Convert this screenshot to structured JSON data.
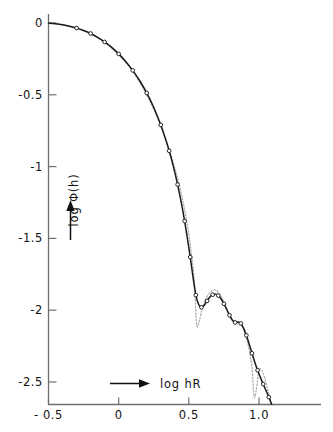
{
  "chart_data": {
    "type": "line",
    "title": "",
    "subtitle": "",
    "xlabel": "log hR",
    "ylabel": "log Φ(h)",
    "xlim": [
      -0.5,
      1.25
    ],
    "ylim": [
      -2.75,
      0.1
    ],
    "grid": false,
    "legend": "none",
    "xticks": [
      -0.5,
      0,
      0.5,
      1.0
    ],
    "xticklabels": [
      "- 0.5",
      "0",
      "0.5",
      "1.0"
    ],
    "yticks": [
      0,
      -0.5,
      -1,
      -1.5,
      -2,
      -2.5
    ],
    "yticklabels": [
      "0",
      "-0.5",
      "-1",
      "-1.5",
      "-2",
      "-2.5"
    ],
    "axis_arrows": {
      "x": "right-arrow",
      "y": "up-arrow"
    },
    "series": [
      {
        "name": "experimental",
        "style": "solid-with-open-circle-markers",
        "color": "#1a1a1a",
        "x": [
          -0.5,
          -0.45,
          -0.4,
          -0.35,
          -0.3,
          -0.25,
          -0.2,
          -0.15,
          -0.1,
          -0.05,
          0.0,
          0.05,
          0.1,
          0.15,
          0.2,
          0.25,
          0.3,
          0.33,
          0.36,
          0.39,
          0.42,
          0.45,
          0.47,
          0.49,
          0.51,
          0.53,
          0.55,
          0.57,
          0.59,
          0.61,
          0.63,
          0.65,
          0.67,
          0.69,
          0.71,
          0.73,
          0.75,
          0.77,
          0.79,
          0.81,
          0.83,
          0.85,
          0.87,
          0.89,
          0.91,
          0.93,
          0.95,
          0.97,
          0.99,
          1.01,
          1.03,
          1.05,
          1.07,
          1.09
        ],
        "y": [
          0.0,
          -0.005,
          -0.012,
          -0.022,
          -0.035,
          -0.052,
          -0.073,
          -0.1,
          -0.132,
          -0.17,
          -0.215,
          -0.268,
          -0.33,
          -0.402,
          -0.487,
          -0.588,
          -0.71,
          -0.795,
          -0.89,
          -1.0,
          -1.125,
          -1.27,
          -1.38,
          -1.5,
          -1.63,
          -1.77,
          -1.895,
          -1.96,
          -1.98,
          -1.965,
          -1.935,
          -1.908,
          -1.892,
          -1.888,
          -1.898,
          -1.922,
          -1.955,
          -1.995,
          -2.035,
          -2.068,
          -2.085,
          -2.082,
          -2.092,
          -2.125,
          -2.175,
          -2.235,
          -2.3,
          -2.362,
          -2.418,
          -2.468,
          -2.515,
          -2.56,
          -2.605,
          -2.655
        ]
      },
      {
        "name": "theoretical",
        "style": "dotted",
        "color": "#b0b0b0",
        "x": [
          -0.5,
          -0.4,
          -0.3,
          -0.2,
          -0.1,
          0.0,
          0.1,
          0.2,
          0.28,
          0.34,
          0.4,
          0.44,
          0.47,
          0.5,
          0.52,
          0.54,
          0.555,
          0.57,
          0.59,
          0.61,
          0.63,
          0.65,
          0.67,
          0.69,
          0.71,
          0.73,
          0.75,
          0.77,
          0.79,
          0.81,
          0.83,
          0.85,
          0.87,
          0.89,
          0.91,
          0.93,
          0.95,
          0.965,
          0.98,
          1.0,
          1.02,
          1.04,
          1.06,
          1.08,
          1.09
        ],
        "y": [
          0.0,
          -0.012,
          -0.036,
          -0.075,
          -0.135,
          -0.22,
          -0.338,
          -0.5,
          -0.67,
          -0.825,
          -1.01,
          -1.16,
          -1.3,
          -1.47,
          -1.62,
          -1.81,
          -2.095,
          -2.09,
          -2.01,
          -1.945,
          -1.905,
          -1.878,
          -1.862,
          -1.86,
          -1.875,
          -1.905,
          -1.945,
          -1.99,
          -2.035,
          -2.072,
          -2.092,
          -2.085,
          -2.095,
          -2.135,
          -2.195,
          -2.275,
          -2.4,
          -2.6,
          -2.56,
          -2.42,
          -2.42,
          -2.47,
          -2.545,
          -2.625,
          -2.66
        ]
      }
    ]
  },
  "axis": {
    "x_arrow_label": "log hR",
    "y_arrow_label": "log Φ(h)"
  }
}
